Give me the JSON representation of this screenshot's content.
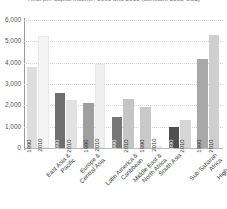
{
  "chart_data": {
    "type": "bar",
    "title": "Real per capita income, 1990 and 2010 (constant 2005 US$)",
    "xlabel": "",
    "ylabel": "",
    "ylim": [
      0,
      6000
    ],
    "ytick_values": [
      0,
      1000,
      2000,
      3000,
      4000,
      5000,
      6000
    ],
    "ytick_labels": [
      "0",
      "1,000",
      "2,000",
      "3,000",
      "4,000",
      "5,000",
      "6,000"
    ],
    "grid": true,
    "legend": "none",
    "series_labels": [
      "1990",
      "2010"
    ],
    "categories": [
      "East Asia & Pacific",
      "Europe & Central Asia",
      "Latin America & Caribbean",
      "Middle East & North Africa",
      "South Asia",
      "Sub-Saharan Africa",
      "High-income"
    ],
    "category_lines": [
      [
        "East Asia &",
        "Pacific"
      ],
      [
        "Europe &",
        "Central Asia"
      ],
      [
        "Latin America &",
        "Caribbean"
      ],
      [
        "Middle East &",
        "North Africa"
      ],
      [
        "South Asia"
      ],
      [
        "Sub-Saharan",
        "Africa"
      ],
      [
        "High-income"
      ]
    ],
    "series": [
      {
        "name": "1990",
        "values": [
          3800,
          2600,
          2100,
          1450,
          1900,
          1000,
          4150
        ]
      },
      {
        "name": "2010",
        "values": [
          5250,
          2250,
          3950,
          2300,
          60,
          1330,
          5300
        ]
      }
    ],
    "bar_colors_1990": [
      "#dedede",
      "#6f6f6f",
      "#9f9f9f",
      "#777777",
      "#c9c9c9",
      "#4f4f4f",
      "#a8a8a8"
    ],
    "bar_colors_2010": [
      "#f4f4f4",
      "#e2e2e2",
      "#efefef",
      "#c5c5c5",
      "#fbfbfb",
      "#d6d6d6",
      "#cfcfcf"
    ],
    "axis_color": "#9a9a9a",
    "grid_color": "#d2d2d2",
    "background": "#ffffff"
  }
}
